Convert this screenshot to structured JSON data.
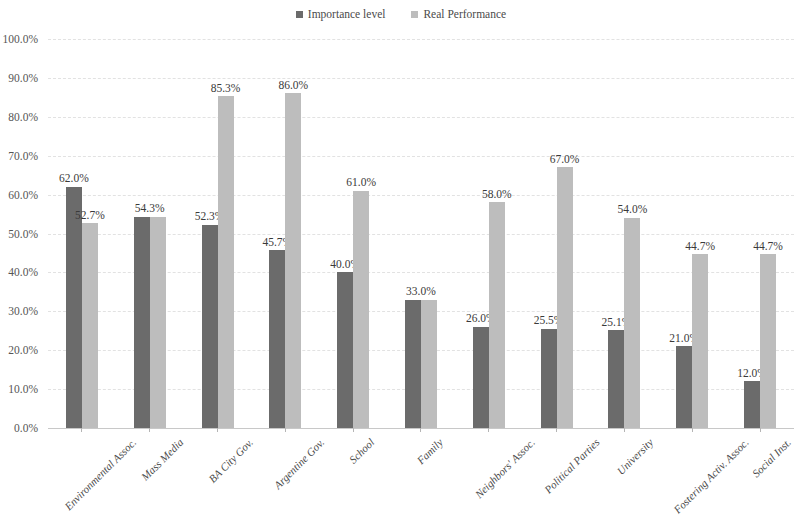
{
  "chart_data": {
    "type": "bar",
    "title": "",
    "subtitle": "",
    "xlabel": "",
    "ylabel": "",
    "ylim": [
      0,
      100
    ],
    "ytick_labels": [
      "100.0%",
      "90.0%",
      "80.0%",
      "70.0%",
      "60.0%",
      "50.0%",
      "40.0%",
      "30.0%",
      "20.0%",
      "10.0%",
      "0.0%"
    ],
    "ytick_values": [
      100,
      90,
      80,
      70,
      60,
      50,
      40,
      30,
      20,
      10,
      0
    ],
    "grid": true,
    "legend_position": "top-center",
    "categories": [
      "Environmental Assoc.",
      "Mass Media",
      "BA City Gov.",
      "Argentine Gov.",
      "School",
      "Family",
      "Neighbors' Assoc.",
      "Political Parties",
      "University",
      "Fostering Activ. Assoc.",
      "Social Inst."
    ],
    "series": [
      {
        "name": "Importance level",
        "color": "#6b6b6b",
        "values": [
          62.0,
          54.3,
          52.3,
          45.7,
          40.0,
          33.0,
          26.0,
          25.5,
          25.1,
          21.0,
          12.0
        ],
        "labels": [
          "62.0%",
          "54.3%",
          "52.3%",
          "45.7%",
          "40.0%",
          "33.0%",
          "26.0%",
          "25.5%",
          "25.1%",
          "21.0%",
          "12.0%"
        ]
      },
      {
        "name": "Real Performance",
        "color": "#bdbdbd",
        "values": [
          52.7,
          54.3,
          85.3,
          86.0,
          61.0,
          33.0,
          58.0,
          67.0,
          54.0,
          44.7,
          44.7
        ],
        "labels": [
          "52.7%",
          "54.3%",
          "85.3%",
          "86.0%",
          "61.0%",
          "33.0%",
          "58.0%",
          "67.0%",
          "54.0%",
          "44.7%",
          "44.7%"
        ]
      }
    ],
    "shared_value_labels": {
      "Mass Media": "54.3%",
      "Family": "33.0%"
    }
  }
}
